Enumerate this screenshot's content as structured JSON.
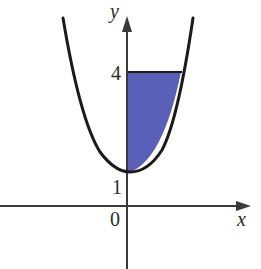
{
  "figure": {
    "axes": {
      "x_label": "x",
      "y_label": "y",
      "origin_label": "0"
    },
    "tick_labels": {
      "y1": "1",
      "y4": "4"
    },
    "curve": {
      "type": "parabola",
      "vertex_y": 1,
      "stroke_color": "#1a1a1a"
    },
    "shaded_region": {
      "bounds": "x = 0, y = 4, curve",
      "y_from": 1,
      "y_to": 4,
      "fill_color": "#5a5fb8"
    },
    "axis_color": "#3a3a3a"
  }
}
